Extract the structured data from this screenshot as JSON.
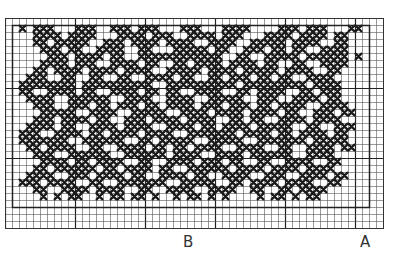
{
  "chart_title": "",
  "labels": {
    "b": "B",
    "a": "A"
  },
  "grid": {
    "cols": 54,
    "rows": 30,
    "cell_px": 7,
    "line_color": "#555555",
    "bold_line_color": "#222222",
    "bold_every": 10,
    "inner_border": {
      "col_start": 1,
      "col_end": 52,
      "row_start": 1,
      "row_end": 27
    },
    "stitch_color": "#1a1a1a",
    "repeat_markers": [
      {
        "label": "B",
        "col": 26
      },
      {
        "label": "A",
        "col": 51
      }
    ]
  },
  "pattern": [
    "......................................................",
    "..X.XXX...XXX..XXX.XXX...XXX...XXXX....XXX.XXX...XX...",
    "....XXXX.XXXX...XXXX.XXX..XXXX.XXX...XXXX.XXXX.XX.....",
    "....XX.XXXXX..XXX.XXXX.XXXX..XXXX..XXXXX.XXXX..XX.....",
    ".....XXX.XX..XXXX..XX...XXXXX.XX..XXX.XX.XX..XXXX.....",
    "......XXX.XXXX.XX..XXXXXXXXXXXX..XX..XXXXX.XXXXXX.X...",
    ".....XXXX.XXX..XXXX.XX..XX.XXXX.XXXX.XX..XX..XXXX.....",
    "....XX.XXXX.XXXX.XXXX..XXXXX.XXXX.XXXXX.XXXX..XX......",
    "...XXX..XX..XX..XX..XXXX.XX..XX.XXX.XX.XX..XXXX.......",
    "..XXXXXXXX.XXXXXXXXXX..XXXXXXXXXX.XXXXXXXXX.XXXX......",
    "..XX..XXXX.XX..XXXX.XX.XX..XXXX..XX.XXXX..XX.XXX......",
    "...XXXX..XXXXXX..XXXX..XXXX..XXXXX..XXX..XXXX.XX......",
    "....XXX..XXX.XX.XXX.XX.XXXX.XXX.XXX.XX.XXXX..XXXX.....",
    ".....XXXXX..XXXX..XXXXX..XXXX.XXXX.XXXX.XX..XXX.XX....",
    "....XXX.XXXX.XX..XXX.XXXX.XXXX..XX.XX..XXXX.XXXX......",
    "...XXXX.XX..XXXX.XXXX..XXXX.XX.XXXX.XXXXX..XX..XXX....",
    "..XXX..XXXX.XX.XXXX.XXXX..XXXXXXX.XXXX.XX.XXXX.XX.....",
    "..XXXXXXX..XXXXXX..XX.XXXXX..XXXXX..XXXXXXX.XXXXX.....",
    "...XX.XXXX..XX..XXXX.XX.XX.XXXX..XXXX..XX..XXXX.XX....",
    "....XXX..XXXXXX..XXXXXX.XXXX..XXXX.XXXXXX..XXXX.......",
    ".....XXXX.XX.XXXX..XX..XXXX.XXX.XX..XX..XXXX..XX......",
    "....XX.XXXXXX.XX.XXXX.XX..XXXXXX.XXXX.XXXX.XXXX.......",
    "...XXXX..XXX.XXXX.XX..XXXX.XX..XXXX..XXX..XXXX.XX.....",
    "..XXX.XXXX..XX..XXXXXXX..XXXXX..XX.XXXX.XXXX..XX......",
    "....XX..XXXX.XXXX..XX..XXXX..XXXX..XX..XX.XXXX........",
    ".....X.X.XX..X.XX.XX.X..X.XX.X.X....X.XX.X.XX.........",
    "......................................................",
    "......................................................",
    "......................................................",
    "......................................................"
  ]
}
